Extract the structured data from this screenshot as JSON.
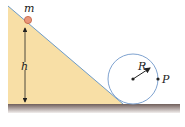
{
  "diagram": {
    "labels": {
      "mass": "m",
      "height": "h",
      "radius": "R",
      "point": "P"
    },
    "colors": {
      "incline_fill": "#F8DFA6",
      "incline_edge": "#6E9CC8",
      "circle_stroke": "#7FA3D0",
      "ball_fill": "#E9967A",
      "ball_stroke": "#C0603F",
      "ground_top": "#7A6A66",
      "ground_bottom": "#EDE7E6",
      "arrow": "#222222"
    }
  }
}
